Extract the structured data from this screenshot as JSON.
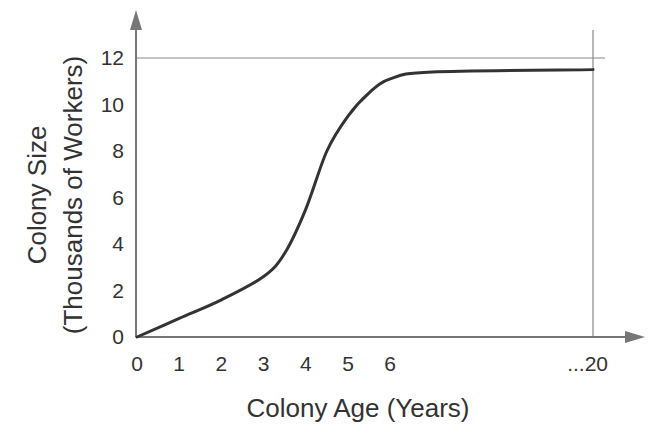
{
  "chart_data": {
    "type": "line",
    "title": "",
    "xlabel": "Colony Age (Years)",
    "ylabel_line1": "Colony Size",
    "ylabel_line2": "(Thousands of Workers)",
    "x_ticks": [
      "0",
      "1",
      "2",
      "3",
      "4",
      "5",
      "6",
      "...20"
    ],
    "x_tick_values": [
      0,
      1,
      2,
      3,
      4,
      5,
      6,
      20
    ],
    "y_ticks": [
      "0",
      "2",
      "4",
      "6",
      "8",
      "10",
      "12"
    ],
    "y_tick_values": [
      0,
      2,
      4,
      6,
      8,
      10,
      12
    ],
    "ylim": [
      0,
      12
    ],
    "xlim": [
      0,
      20
    ],
    "grid": false,
    "legend": null,
    "reference_lines": [
      {
        "orientation": "horizontal",
        "y": 12
      },
      {
        "orientation": "vertical",
        "x": 20
      }
    ],
    "series": [
      {
        "name": "Colony size",
        "x": [
          0,
          1,
          2,
          3,
          3.5,
          4,
          4.5,
          5,
          5.5,
          6,
          7,
          20
        ],
        "values": [
          0,
          0.8,
          1.6,
          2.6,
          3.6,
          5.5,
          8.0,
          9.5,
          10.5,
          11.1,
          11.4,
          11.5
        ]
      }
    ]
  },
  "colors": {
    "axis": "#777777",
    "curve": "#333333",
    "text": "#333333",
    "reference_line": "#888888"
  }
}
